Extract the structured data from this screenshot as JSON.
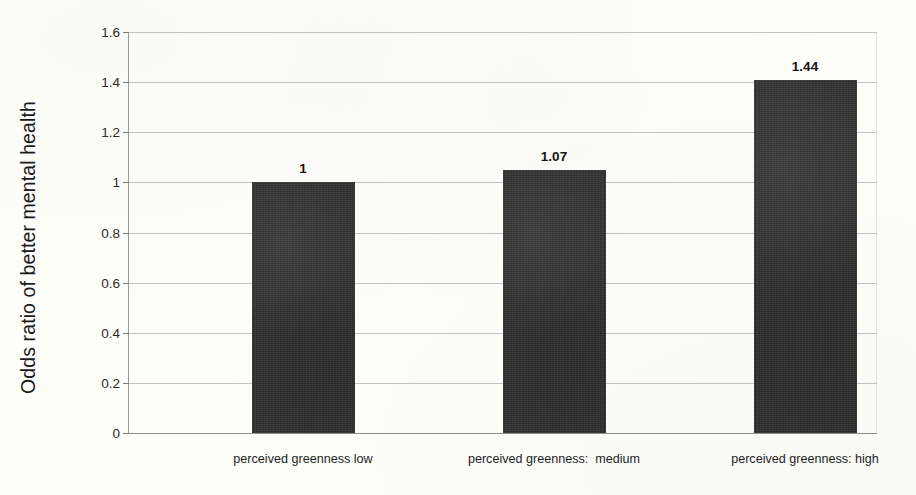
{
  "chart_data": {
    "type": "bar",
    "title": "",
    "subtitle": "",
    "xlabel": "",
    "ylabel": "Odds ratio of better mental health",
    "categories": [
      "perceived greenness low",
      "perceived greenness:  medium",
      "perceived greenness: high"
    ],
    "values": [
      1,
      1.07,
      1.44
    ],
    "bar_tops_plotted": [
      1.0,
      1.05,
      1.41
    ],
    "data_labels": [
      "1",
      "1.07",
      "1.44"
    ],
    "ylim": [
      0,
      1.6
    ],
    "ytick_values": [
      0,
      0.2,
      0.4,
      0.6,
      0.8,
      1,
      1.2,
      1.4,
      1.6
    ],
    "ytick_labels": [
      "0",
      "0.2",
      "0.4",
      "0.6",
      "0.8",
      "1",
      "1.2",
      "1.4",
      "1.6"
    ],
    "grid": "horizontal",
    "legend": "none",
    "series": [
      {
        "name": "Odds ratio of better mental health",
        "values": [
          1,
          1.07,
          1.44
        ]
      }
    ],
    "colors": {
      "bar_fill": "#2f2f2f",
      "gridline": "#b9b9b9",
      "axis": "#9a9a9a",
      "text": "#1a1a1a",
      "background": "#fdfdfa"
    }
  }
}
